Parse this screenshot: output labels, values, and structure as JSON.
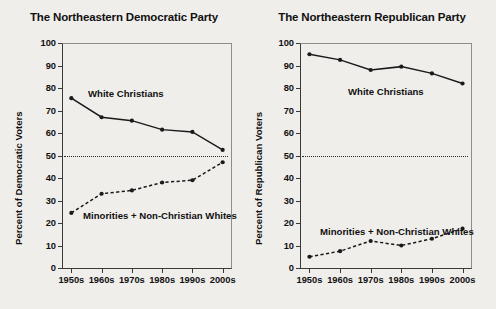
{
  "figure": {
    "background_color": "#f0eeeb",
    "axis_color": "#3a3a3a",
    "series_color": "#1a1a1a"
  },
  "charts": [
    {
      "id": "democratic",
      "title": "The Northeastern Democratic Party",
      "ylabel": "Percent of Democratic Voters",
      "label_white": "White Christians",
      "label_minorities": "Minorities + Non-Christian Whites"
    },
    {
      "id": "republican",
      "title": "The Northeastern Republican Party",
      "ylabel": "Percent of Republican Voters",
      "label_white": "White Christians",
      "label_minorities": "Minorities + Non-Christian Whites"
    }
  ],
  "axis": {
    "yticks": [
      100,
      90,
      80,
      70,
      60,
      50,
      40,
      30,
      20,
      10,
      0
    ],
    "xticks": [
      "1950s",
      "1960s",
      "1970s",
      "1980s",
      "1990s",
      "2000s"
    ],
    "ylim": [
      0,
      100
    ],
    "reference_line_value": 50
  },
  "chart_data": [
    {
      "type": "line",
      "title": "The Northeastern Democratic Party",
      "xlabel": "",
      "ylabel": "Percent of Democratic Voters",
      "categories": [
        "1950s",
        "1960s",
        "1970s",
        "1980s",
        "1990s",
        "2000s"
      ],
      "ylim": [
        0,
        100
      ],
      "grid": false,
      "legend": "inline-annotations",
      "annotations": [
        {
          "text": "White Christians",
          "series": "White Christians"
        },
        {
          "text": "Minorities + Non-Christian Whites",
          "series": "Minorities + Non-Christian Whites"
        }
      ],
      "reference_line": {
        "y": 50,
        "style": "dotted"
      },
      "series": [
        {
          "name": "White Christians",
          "style": "solid",
          "marker": "circle",
          "values": [
            75.5,
            67.0,
            65.5,
            61.5,
            60.5,
            52.5
          ]
        },
        {
          "name": "Minorities + Non-Christian Whites",
          "style": "dashed",
          "marker": "circle",
          "values": [
            24.5,
            33.0,
            34.5,
            38.0,
            39.0,
            47.0
          ]
        }
      ]
    },
    {
      "type": "line",
      "title": "The Northeastern Republican Party",
      "xlabel": "",
      "ylabel": "Percent of Republican Voters",
      "categories": [
        "1950s",
        "1960s",
        "1970s",
        "1980s",
        "1990s",
        "2000s"
      ],
      "ylim": [
        0,
        100
      ],
      "grid": false,
      "legend": "inline-annotations",
      "annotations": [
        {
          "text": "White Christians",
          "series": "White Christians"
        },
        {
          "text": "Minorities + Non-Christian Whites",
          "series": "Minorities + Non-Christian Whites"
        }
      ],
      "reference_line": {
        "y": 50,
        "style": "dotted"
      },
      "series": [
        {
          "name": "White Christians",
          "style": "solid",
          "marker": "circle",
          "values": [
            95.0,
            92.5,
            88.0,
            89.5,
            86.5,
            82.0
          ]
        },
        {
          "name": "Minorities + Non-Christian Whites",
          "style": "dashed",
          "marker": "circle",
          "values": [
            5.0,
            7.5,
            12.0,
            10.0,
            13.0,
            17.5
          ]
        }
      ]
    }
  ]
}
